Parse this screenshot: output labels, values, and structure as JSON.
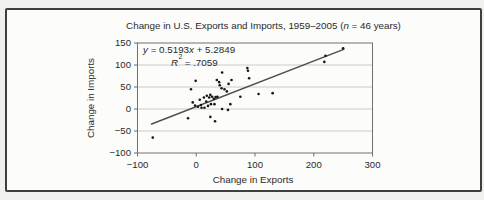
{
  "chart_data": {
    "type": "scatter",
    "title": "Change in U.S. Exports and Imports, 1959–2005 (n = 46 years)",
    "title_pre": "Change in U.S. Exports and Imports, 1959–2005 (",
    "title_n": "n",
    "title_post": " = 46 years)",
    "xlabel": "Change in Exports",
    "ylabel": "Change in Imports",
    "xlim": [
      -100,
      300
    ],
    "ylim": [
      -100,
      150
    ],
    "x_ticks": [
      -100,
      0,
      100,
      200,
      300
    ],
    "y_ticks": [
      150,
      100,
      50,
      0,
      -50,
      -100
    ],
    "gridlines": {
      "horizontal": [
        100,
        50,
        0,
        -50
      ],
      "vertical": false
    },
    "legend": "none",
    "n_years": 46,
    "r_squared": 0.7059,
    "equation": {
      "y_var": "y",
      "body": " = 0.5193",
      "x_var": "x",
      "tail": " + 5.2849",
      "r_var": "R",
      "r_exp": "2",
      "r_body": " = .7059"
    },
    "trendline": {
      "slope": 0.5193,
      "intercept": 5.2849,
      "x_start": -77,
      "x_end": 252
    },
    "points": [
      [
        -74,
        -65
      ],
      [
        -14,
        -21
      ],
      [
        -9,
        45
      ],
      [
        -6,
        15
      ],
      [
        -2,
        8
      ],
      [
        -1,
        64
      ],
      [
        3,
        5
      ],
      [
        6,
        21
      ],
      [
        8,
        9
      ],
      [
        9,
        3
      ],
      [
        13,
        26
      ],
      [
        14,
        3
      ],
      [
        17,
        17
      ],
      [
        18,
        30
      ],
      [
        20,
        7
      ],
      [
        22,
        26
      ],
      [
        24,
        32
      ],
      [
        24,
        -18
      ],
      [
        25,
        11
      ],
      [
        27,
        28
      ],
      [
        30,
        23
      ],
      [
        31,
        11
      ],
      [
        32,
        -28
      ],
      [
        33,
        27
      ],
      [
        35,
        66
      ],
      [
        36,
        28
      ],
      [
        39,
        61
      ],
      [
        40,
        54
      ],
      [
        43,
        47
      ],
      [
        44,
        0
      ],
      [
        44,
        83
      ],
      [
        48,
        45
      ],
      [
        52,
        40
      ],
      [
        54,
        -2
      ],
      [
        55,
        57
      ],
      [
        58,
        11
      ],
      [
        60,
        66
      ],
      [
        75,
        28
      ],
      [
        87,
        93
      ],
      [
        88,
        87
      ],
      [
        90,
        70
      ],
      [
        106,
        34
      ],
      [
        130,
        36
      ],
      [
        218,
        107
      ],
      [
        220,
        121
      ],
      [
        250,
        138
      ]
    ],
    "colors": {
      "background": "#f0f0ed",
      "panel": "#fcfcfa",
      "frame_border": "#3f3f3f",
      "grid": "#bfbfbf",
      "axis": "#707070",
      "point": "#161616",
      "trendline": "#4d4d4d",
      "text": "#2a2a2a"
    }
  }
}
